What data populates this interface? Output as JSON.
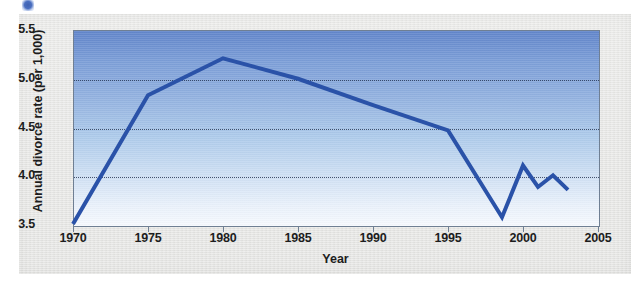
{
  "figure": {
    "paper_background": "#e6e6e4",
    "plot_background_top": "#6286cb",
    "plot_background_bottom": "#f6f9fe",
    "series_color": "#2a52a8",
    "gridline_color": "#2b3a57",
    "axis_color": "#6f7f93",
    "artifact_name": "scan-artifact-blue-dot"
  },
  "chart_data": {
    "type": "line",
    "title": "",
    "subtitle": "",
    "xlabel": "Year",
    "ylabel": "Annual divorce rate (per 1,000)",
    "xlim": [
      1970,
      2005
    ],
    "ylim": [
      3.5,
      5.5
    ],
    "xticks": [
      1970,
      1975,
      1980,
      1985,
      1990,
      1995,
      2000,
      2005
    ],
    "xtick_labels": [
      "1970",
      "1975",
      "1980",
      "1985",
      "1990",
      "1995",
      "2000",
      "2005"
    ],
    "yticks": [
      3.5,
      4.0,
      4.5,
      5.0,
      5.5
    ],
    "ytick_labels": [
      "3.5",
      "4.0",
      "4.5",
      "5.0",
      "5.5"
    ],
    "grid": true,
    "grid_axis": "y",
    "grid_style": "dotted",
    "legend": false,
    "legend_position": "none",
    "annotations": [],
    "series": [
      {
        "name": "Annual divorce rate (per 1,000)",
        "color": "#2a52a8",
        "line_width": 4,
        "markers": false,
        "x": [
          1970,
          1975,
          1980,
          1985,
          1990,
          1995,
          1998.6,
          2000,
          2001,
          2002,
          2003
        ],
        "y": [
          3.51,
          4.83,
          5.21,
          5.0,
          4.73,
          4.47,
          3.58,
          4.11,
          3.89,
          4.01,
          3.86
        ]
      }
    ]
  }
}
